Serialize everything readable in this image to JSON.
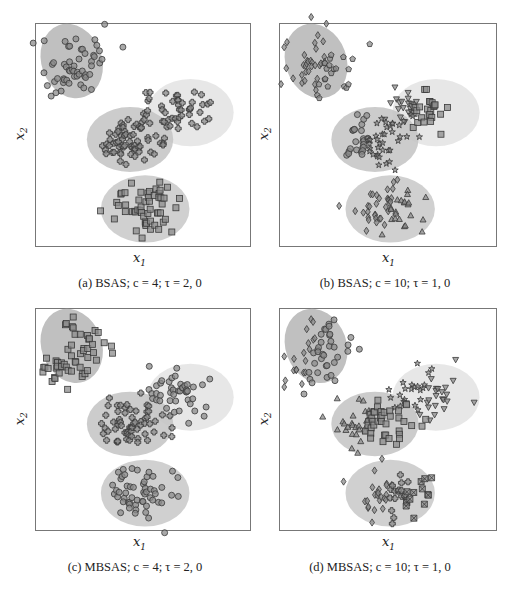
{
  "figure": {
    "panels": [
      {
        "id": "a",
        "caption": "(a) BSAS; c = 4; τ = 2, 0",
        "xlabel": "x1",
        "ylabel": "x2"
      },
      {
        "id": "b",
        "caption": "(b) BSAS; c = 10; τ = 1, 0",
        "xlabel": "x1",
        "ylabel": "x2"
      },
      {
        "id": "c",
        "caption": "(c) MBSAS; c = 4; τ = 2, 0",
        "xlabel": "x1",
        "ylabel": "x2"
      },
      {
        "id": "d",
        "caption": "(d) MBSAS; c = 10; τ = 1, 0",
        "xlabel": "x1",
        "ylabel": "x2"
      }
    ]
  },
  "chart_data": [
    {
      "type": "scatter",
      "title": "(a) BSAS; c = 4; τ = 2, 0",
      "xlabel": "x1",
      "ylabel": "x2",
      "grid": false,
      "background_clusters": [
        {
          "name": "top-left",
          "cx": 0.17,
          "cy": 0.17,
          "rx": 0.14,
          "ry": 0.17,
          "rotation": -20,
          "fill": "#b5b5b5"
        },
        {
          "name": "right",
          "cx": 0.72,
          "cy": 0.4,
          "rx": 0.2,
          "ry": 0.15,
          "rotation": 0,
          "fill": "#e2e2e2"
        },
        {
          "name": "middle",
          "cx": 0.44,
          "cy": 0.52,
          "rx": 0.2,
          "ry": 0.14,
          "rotation": 0,
          "fill": "#c4c4c4"
        },
        {
          "name": "bottom",
          "cx": 0.51,
          "cy": 0.83,
          "rx": 0.2,
          "ry": 0.15,
          "rotation": 0,
          "fill": "#c8c8c8"
        }
      ],
      "series": [
        {
          "name": "cluster 1",
          "marker": "circle",
          "region": "top-left"
        },
        {
          "name": "cluster 2",
          "marker": "plus",
          "region": "middle+right"
        },
        {
          "name": "cluster 3",
          "marker": "square",
          "region": "bottom"
        }
      ]
    },
    {
      "type": "scatter",
      "title": "(b) BSAS; c = 10; τ = 1, 0",
      "xlabel": "x1",
      "ylabel": "x2",
      "grid": false,
      "series": [
        {
          "name": "cluster 1",
          "marker": "diamond",
          "region": "top-left"
        },
        {
          "name": "cluster 2",
          "marker": "pentagon",
          "region": "top-left"
        },
        {
          "name": "cluster 3",
          "marker": "triangle-down",
          "region": "right"
        },
        {
          "name": "cluster 4",
          "marker": "square",
          "region": "right"
        },
        {
          "name": "cluster 5",
          "marker": "circle",
          "region": "middle"
        },
        {
          "name": "cluster 6",
          "marker": "star",
          "region": "middle"
        },
        {
          "name": "cluster 7",
          "marker": "diamond",
          "region": "bottom"
        },
        {
          "name": "cluster 8",
          "marker": "triangle-up",
          "region": "bottom"
        }
      ]
    },
    {
      "type": "scatter",
      "title": "(c) MBSAS; c = 4; τ = 2, 0",
      "xlabel": "x1",
      "ylabel": "x2",
      "grid": false,
      "series": [
        {
          "name": "cluster 1",
          "marker": "square",
          "region": "top-left"
        },
        {
          "name": "cluster 2",
          "marker": "plus",
          "region": "middle"
        },
        {
          "name": "cluster 3",
          "marker": "circle",
          "region": "right+bottom"
        }
      ]
    },
    {
      "type": "scatter",
      "title": "(d) MBSAS; c = 10; τ = 1, 0",
      "xlabel": "x1",
      "ylabel": "x2",
      "grid": false,
      "series": [
        {
          "name": "cluster 1",
          "marker": "diamond",
          "region": "top-left"
        },
        {
          "name": "cluster 2",
          "marker": "circle",
          "region": "top-left"
        },
        {
          "name": "cluster 3",
          "marker": "star",
          "region": "right"
        },
        {
          "name": "cluster 4",
          "marker": "triangle-down",
          "region": "right"
        },
        {
          "name": "cluster 5",
          "marker": "triangle-up",
          "region": "middle"
        },
        {
          "name": "cluster 6",
          "marker": "square",
          "region": "middle"
        },
        {
          "name": "cluster 7",
          "marker": "diamond",
          "region": "bottom"
        },
        {
          "name": "cluster 8",
          "marker": "plus",
          "region": "bottom"
        },
        {
          "name": "cluster 9",
          "marker": "square-x",
          "region": "bottom"
        }
      ]
    }
  ]
}
